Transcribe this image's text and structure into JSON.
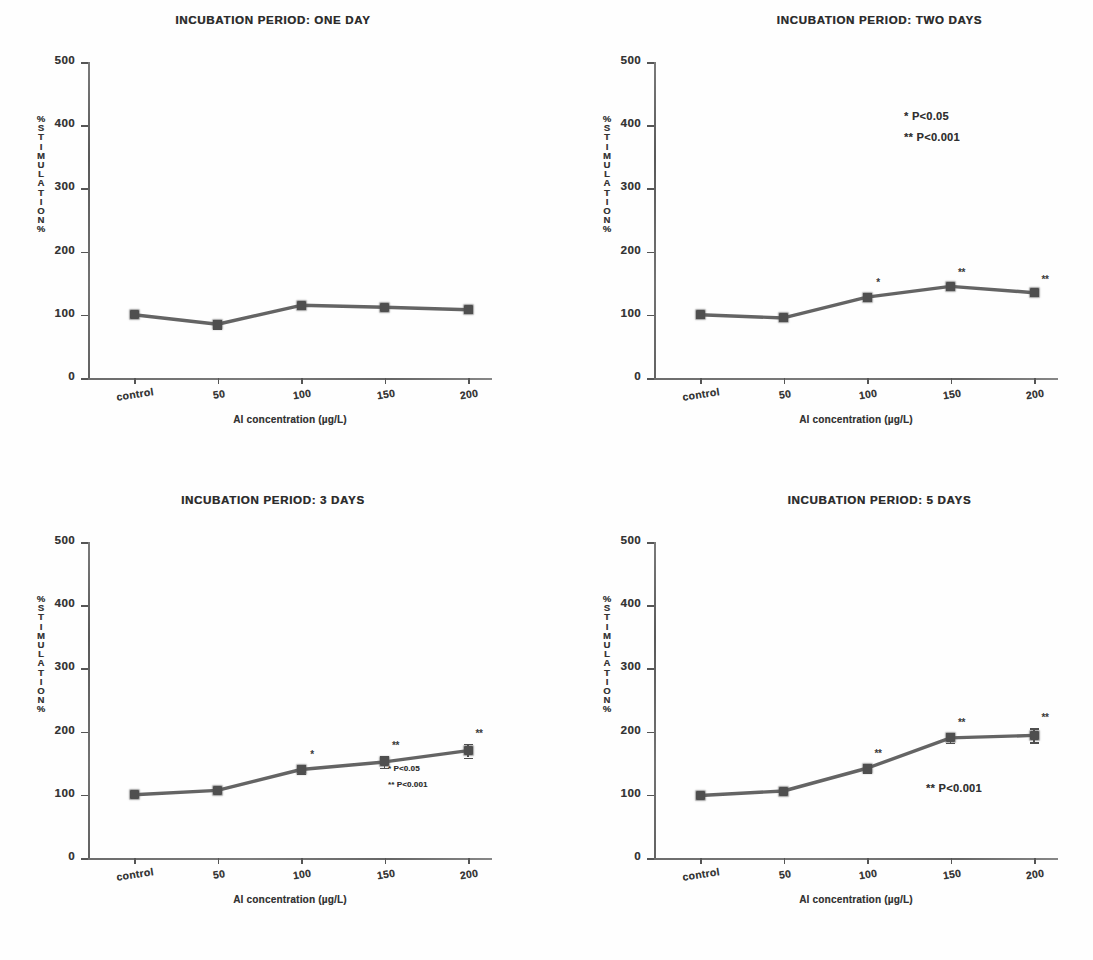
{
  "figure": {
    "kind": "multi-panel-line-chart",
    "panel_count": 4,
    "layout": "2x2"
  },
  "axes_common": {
    "ylabel_stacked": [
      "%",
      "S",
      "T",
      "I",
      "M",
      "U",
      "L",
      "A",
      "T",
      "I",
      "O",
      "N",
      "%"
    ],
    "ylabel_text": "% STIMULATION %",
    "xlabel": "Al concentration (µg/L)",
    "ytick_labels": [
      "500",
      "400",
      "300",
      "200",
      "100",
      "0"
    ],
    "ytick_values": [
      500,
      400,
      300,
      200,
      100,
      0
    ],
    "xtick_labels": [
      "control",
      "50",
      "100",
      "150",
      "200"
    ],
    "ylim": [
      0,
      500
    ],
    "grid": false
  },
  "chart_data": [
    {
      "type": "line",
      "title": "INCUBATION PERIOD: ONE DAY",
      "xlabel": "Al concentration (µg/L)",
      "ylabel": "% STIMULATION",
      "categories": [
        "control",
        "50",
        "100",
        "150",
        "200"
      ],
      "values": [
        100,
        85,
        115,
        112,
        108
      ],
      "errors": [
        3,
        6,
        5,
        4,
        4
      ],
      "significance": [
        "",
        "",
        "",
        "",
        ""
      ],
      "ylim": [
        0,
        500
      ],
      "yticks": [
        0,
        100,
        200,
        300,
        400,
        500
      ],
      "legend": [],
      "legend_position": "none",
      "grid": false
    },
    {
      "type": "line",
      "title": "INCUBATION PERIOD: TWO DAYS",
      "xlabel": "Al concentration (µg/L)",
      "ylabel": "% STIMULATION",
      "categories": [
        "control",
        "50",
        "100",
        "150",
        "200"
      ],
      "values": [
        100,
        95,
        128,
        145,
        135
      ],
      "errors": [
        5,
        4,
        6,
        5,
        5
      ],
      "significance": [
        "",
        "",
        "*",
        "**",
        "**"
      ],
      "ylim": [
        0,
        500
      ],
      "yticks": [
        0,
        100,
        200,
        300,
        400,
        500
      ],
      "legend": [
        "* P<0.05",
        "** P<0.001"
      ],
      "legend_position": "upper-right",
      "grid": false
    },
    {
      "type": "line",
      "title": "INCUBATION PERIOD: 3 DAYS",
      "xlabel": "Al concentration (µg/L)",
      "ylabel": "% STIMULATION",
      "categories": [
        "control",
        "50",
        "100",
        "150",
        "200"
      ],
      "values": [
        100,
        107,
        140,
        152,
        170
      ],
      "errors": [
        3,
        4,
        7,
        9,
        11
      ],
      "significance": [
        "",
        "",
        "*",
        "**",
        "**"
      ],
      "ylim": [
        0,
        500
      ],
      "yticks": [
        0,
        100,
        200,
        300,
        400,
        500
      ],
      "legend": [
        "* P<0.05",
        "** P<0.001"
      ],
      "legend_position": "lower-right",
      "grid": false
    },
    {
      "type": "line",
      "title": "INCUBATION PERIOD: 5 DAYS",
      "xlabel": "Al concentration (µg/L)",
      "ylabel": "% STIMULATION",
      "categories": [
        "control",
        "50",
        "100",
        "150",
        "200"
      ],
      "values": [
        99,
        106,
        142,
        190,
        194
      ],
      "errors": [
        2,
        3,
        6,
        8,
        11
      ],
      "significance": [
        "",
        "",
        "**",
        "**",
        "**"
      ],
      "ylim": [
        0,
        500
      ],
      "yticks": [
        0,
        100,
        200,
        300,
        400,
        500
      ],
      "legend": [
        "** P<0.001"
      ],
      "legend_position": "lower-right",
      "grid": false
    }
  ],
  "colors": {
    "line": "#4f4f4f",
    "marker": "#4f4f4f",
    "axis": "#555555",
    "text": "#2e2e2e",
    "background": "#fefefe"
  }
}
